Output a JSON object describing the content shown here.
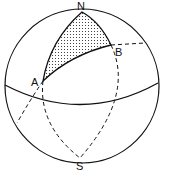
{
  "diagram": {
    "labels": {
      "north": "N",
      "south": "S",
      "point_a": "A",
      "point_b": "B"
    },
    "colors": {
      "stroke": "#111111",
      "background": "#ffffff",
      "stipple": "#222222"
    },
    "regions": [
      {
        "name": "spherical-triangle",
        "vertices": [
          "N",
          "A",
          "B"
        ],
        "fill": "stippled"
      }
    ]
  }
}
